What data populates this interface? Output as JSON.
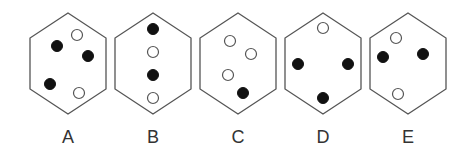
{
  "figure": {
    "colors": {
      "outline": "#555555",
      "filled_dot": "#111111",
      "open_dot_fill": "#ffffff",
      "label": "#333333"
    },
    "options": [
      {
        "label": "A",
        "center_x": 68,
        "dots": [
          {
            "type": "filled",
            "x": 57,
            "y": 46
          },
          {
            "type": "open",
            "x": 77,
            "y": 35
          },
          {
            "type": "filled",
            "x": 88,
            "y": 56
          },
          {
            "type": "filled",
            "x": 50,
            "y": 84
          },
          {
            "type": "open",
            "x": 79,
            "y": 93
          }
        ]
      },
      {
        "label": "B",
        "center_x": 153,
        "dots": [
          {
            "type": "filled",
            "x": 153,
            "y": 29
          },
          {
            "type": "open",
            "x": 153,
            "y": 52
          },
          {
            "type": "filled",
            "x": 153,
            "y": 75
          },
          {
            "type": "open",
            "x": 153,
            "y": 98
          }
        ]
      },
      {
        "label": "C",
        "center_x": 238,
        "dots": [
          {
            "type": "open",
            "x": 230,
            "y": 41
          },
          {
            "type": "open",
            "x": 251,
            "y": 54
          },
          {
            "type": "open",
            "x": 228,
            "y": 75
          },
          {
            "type": "filled",
            "x": 243,
            "y": 93
          }
        ]
      },
      {
        "label": "D",
        "center_x": 323,
        "dots": [
          {
            "type": "open",
            "x": 323,
            "y": 28
          },
          {
            "type": "filled",
            "x": 298,
            "y": 64
          },
          {
            "type": "filled",
            "x": 348,
            "y": 64
          },
          {
            "type": "filled",
            "x": 323,
            "y": 98
          }
        ]
      },
      {
        "label": "E",
        "center_x": 408,
        "dots": [
          {
            "type": "open",
            "x": 396,
            "y": 38
          },
          {
            "type": "filled",
            "x": 383,
            "y": 57
          },
          {
            "type": "filled",
            "x": 423,
            "y": 54
          },
          {
            "type": "open",
            "x": 398,
            "y": 94
          }
        ]
      }
    ]
  }
}
